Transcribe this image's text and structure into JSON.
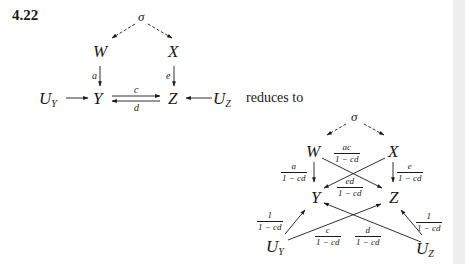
{
  "problem": {
    "number": "4.22",
    "connector_text": "reduces to"
  },
  "original_diagram": {
    "nodes": {
      "sigma": "σ",
      "W": "W",
      "X": "X",
      "Y": "Y",
      "Z": "Z",
      "UY_base": "U",
      "UY_sub": "Y",
      "UZ_base": "U",
      "UZ_sub": "Z"
    },
    "edges": [
      {
        "from": "σ",
        "to": "W",
        "style": "dashed",
        "label": ""
      },
      {
        "from": "σ",
        "to": "X",
        "style": "dashed",
        "label": ""
      },
      {
        "from": "W",
        "to": "Y",
        "style": "solid",
        "label": "a"
      },
      {
        "from": "X",
        "to": "Z",
        "style": "solid",
        "label": "e"
      },
      {
        "from": "Y",
        "to": "Z",
        "style": "solid",
        "label": "c"
      },
      {
        "from": "Z",
        "to": "Y",
        "style": "solid",
        "label": "d"
      },
      {
        "from": "U_Y",
        "to": "Y",
        "style": "solid",
        "label": ""
      },
      {
        "from": "U_Z",
        "to": "Z",
        "style": "solid",
        "label": ""
      }
    ],
    "labels": {
      "a": "a",
      "e": "e",
      "c": "c",
      "d": "d"
    }
  },
  "reduced_diagram": {
    "nodes": {
      "sigma": "σ",
      "W": "W",
      "X": "X",
      "Y": "Y",
      "Z": "Z",
      "UY_base": "U",
      "UY_sub": "Y",
      "UZ_base": "U",
      "UZ_sub": "Z"
    },
    "edges": [
      {
        "from": "σ",
        "to": "W",
        "style": "dashed",
        "label": ""
      },
      {
        "from": "σ",
        "to": "X",
        "style": "dashed",
        "label": ""
      },
      {
        "from": "W",
        "to": "Y",
        "style": "solid",
        "label": "a / (1 − cd)"
      },
      {
        "from": "W",
        "to": "Z",
        "style": "solid",
        "label": "ac / (1 − cd)"
      },
      {
        "from": "X",
        "to": "Y",
        "style": "solid",
        "label": "ed / (1 − cd)"
      },
      {
        "from": "X",
        "to": "Z",
        "style": "solid",
        "label": "e / (1 − cd)"
      },
      {
        "from": "U_Y",
        "to": "Y",
        "style": "solid",
        "label": "1 / (1 − cd)"
      },
      {
        "from": "U_Y",
        "to": "Z",
        "style": "solid",
        "label": "c / (1 − cd)"
      },
      {
        "from": "U_Z",
        "to": "Y",
        "style": "solid",
        "label": "d / (1 − cd)"
      },
      {
        "from": "U_Z",
        "to": "Z",
        "style": "solid",
        "label": "1 / (1 − cd)"
      }
    ],
    "fractions": {
      "W_Y": {
        "num": "a",
        "den": "1 − cd"
      },
      "W_Z": {
        "num": "ac",
        "den": "1 − cd"
      },
      "X_Y": {
        "num": "ed",
        "den": "1 − cd"
      },
      "X_Z": {
        "num": "e",
        "den": "1 − cd"
      },
      "UY_Y": {
        "num": "1",
        "den": "1 − cd"
      },
      "UY_Z": {
        "num": "c",
        "den": "1 − cd"
      },
      "UZ_Y": {
        "num": "d",
        "den": "1 − cd"
      },
      "UZ_Z": {
        "num": "1",
        "den": "1 − cd"
      }
    }
  }
}
